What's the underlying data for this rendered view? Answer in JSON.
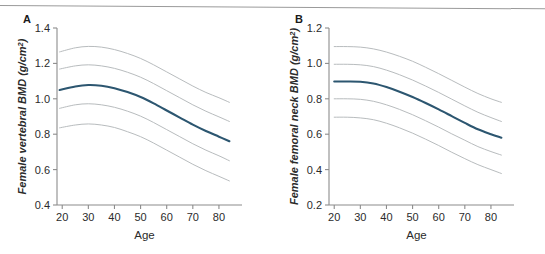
{
  "figure": {
    "panels": [
      {
        "letter": "A",
        "ylabel_main": "Female vertebral BMD (",
        "ylabel_unit_base": "g/cm",
        "ylabel_unit_sup": "2",
        "ylabel_close": ")",
        "xlabel": "Age",
        "yticks": [
          "0.4",
          "0.6",
          "0.8",
          "1.0",
          "1.2",
          "1.4"
        ],
        "xticks": [
          "20",
          "30",
          "40",
          "50",
          "60",
          "70",
          "80"
        ]
      },
      {
        "letter": "B",
        "ylabel_main": "Female femoral neck BMD (",
        "ylabel_unit_base": "g/cm",
        "ylabel_unit_sup": "2",
        "ylabel_close": ")",
        "xlabel": "Age",
        "yticks": [
          "0.2",
          "0.4",
          "0.6",
          "0.8",
          "1.0",
          "1.2"
        ],
        "xticks": [
          "20",
          "30",
          "40",
          "50",
          "60",
          "70",
          "80"
        ]
      }
    ]
  },
  "colors": {
    "median_curve": "#2c5670",
    "percentile_curve": "#b8bcbe",
    "axis": "#8c8c8c",
    "text": "#2b2b2b",
    "rule": "#9a9a9a"
  },
  "chart_data": [
    {
      "type": "line",
      "title": "A",
      "xlabel": "Age",
      "ylabel": "Female vertebral BMD (g/cm2)",
      "xlim": [
        18,
        85
      ],
      "ylim": [
        0.4,
        1.4
      ],
      "xticks": [
        20,
        30,
        40,
        50,
        60,
        70,
        80
      ],
      "yticks": [
        0.4,
        0.6,
        0.8,
        1.0,
        1.2,
        1.4
      ],
      "grid": false,
      "legend": "none",
      "x": [
        19,
        25,
        30,
        35,
        40,
        45,
        50,
        55,
        60,
        65,
        70,
        75,
        80,
        84
      ],
      "series": [
        {
          "name": "97th percentile",
          "values": [
            1.265,
            1.288,
            1.296,
            1.292,
            1.278,
            1.256,
            1.228,
            1.192,
            1.152,
            1.112,
            1.072,
            1.036,
            1.006,
            0.98
          ]
        },
        {
          "name": "84th percentile",
          "values": [
            1.168,
            1.186,
            1.192,
            1.186,
            1.172,
            1.15,
            1.122,
            1.086,
            1.046,
            1.006,
            0.966,
            0.93,
            0.898,
            0.872
          ]
        },
        {
          "name": "Median (50th percentile)",
          "values": [
            1.05,
            1.07,
            1.078,
            1.074,
            1.06,
            1.038,
            1.01,
            0.974,
            0.934,
            0.894,
            0.854,
            0.818,
            0.786,
            0.76
          ]
        },
        {
          "name": "16th percentile",
          "values": [
            0.946,
            0.966,
            0.972,
            0.966,
            0.952,
            0.93,
            0.902,
            0.866,
            0.826,
            0.786,
            0.746,
            0.71,
            0.678,
            0.65
          ]
        },
        {
          "name": "3rd percentile",
          "values": [
            0.836,
            0.852,
            0.858,
            0.852,
            0.838,
            0.814,
            0.786,
            0.75,
            0.71,
            0.67,
            0.63,
            0.594,
            0.562,
            0.536
          ]
        }
      ]
    },
    {
      "type": "line",
      "title": "B",
      "xlabel": "Age",
      "ylabel": "Female femoral neck BMD (g/cm2)",
      "xlim": [
        18,
        85
      ],
      "ylim": [
        0.2,
        1.2
      ],
      "xticks": [
        20,
        30,
        40,
        50,
        60,
        70,
        80
      ],
      "yticks": [
        0.2,
        0.4,
        0.6,
        0.8,
        1.0,
        1.2
      ],
      "grid": false,
      "legend": "none",
      "x": [
        20,
        25,
        30,
        35,
        40,
        45,
        50,
        55,
        60,
        65,
        70,
        75,
        80,
        84
      ],
      "series": [
        {
          "name": "97th percentile",
          "values": [
            1.095,
            1.095,
            1.092,
            1.082,
            1.064,
            1.04,
            1.012,
            0.978,
            0.942,
            0.904,
            0.866,
            0.83,
            0.8,
            0.78
          ]
        },
        {
          "name": "84th percentile",
          "values": [
            0.995,
            0.995,
            0.992,
            0.982,
            0.962,
            0.936,
            0.906,
            0.872,
            0.836,
            0.798,
            0.76,
            0.724,
            0.694,
            0.672
          ]
        },
        {
          "name": "Median (50th percentile)",
          "values": [
            0.898,
            0.898,
            0.896,
            0.886,
            0.866,
            0.84,
            0.81,
            0.776,
            0.74,
            0.702,
            0.664,
            0.628,
            0.6,
            0.58
          ]
        },
        {
          "name": "16th percentile",
          "values": [
            0.8,
            0.8,
            0.797,
            0.786,
            0.766,
            0.74,
            0.71,
            0.676,
            0.64,
            0.602,
            0.566,
            0.53,
            0.502,
            0.482
          ]
        },
        {
          "name": "3rd percentile",
          "values": [
            0.696,
            0.696,
            0.692,
            0.682,
            0.662,
            0.636,
            0.606,
            0.572,
            0.536,
            0.498,
            0.462,
            0.428,
            0.4,
            0.378
          ]
        }
      ]
    }
  ]
}
